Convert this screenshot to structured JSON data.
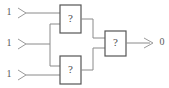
{
  "diagram": {
    "type": "logic-circuit",
    "title": "",
    "canvas": {
      "width": 169,
      "height": 88,
      "background": "#ffffff"
    },
    "colors": {
      "wire": "#8a8a8a",
      "gate_border": "#555555",
      "gate_fill": "#ffffff",
      "text": "#4a4a4a",
      "terminal": "#9a9a9a"
    },
    "inputs": [
      {
        "id": "in1",
        "label": "1",
        "marker": "input-arrow-icon"
      },
      {
        "id": "in2",
        "label": "1",
        "marker": "input-arrow-icon"
      },
      {
        "id": "in3",
        "label": "1",
        "marker": "input-arrow-icon"
      }
    ],
    "gates": [
      {
        "id": "gate-top",
        "label": "?",
        "role": "unknown-gate"
      },
      {
        "id": "gate-bottom",
        "label": "?",
        "role": "unknown-gate"
      },
      {
        "id": "gate-output",
        "label": "?",
        "role": "unknown-gate"
      }
    ],
    "outputs": [
      {
        "id": "out1",
        "label": "0",
        "marker": "output-arrow-icon"
      }
    ]
  }
}
